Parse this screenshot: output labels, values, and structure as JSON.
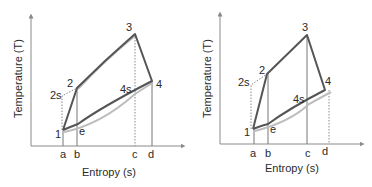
{
  "diagrams": [
    {
      "id": "left",
      "ylabel": "Temperature (T)",
      "xlabel": "Entropy (s)",
      "ticks": [
        "a",
        "b",
        "c",
        "d"
      ],
      "points": {
        "p1": "1",
        "p2": "2",
        "p2s": "2s",
        "p3": "3",
        "p4": "4",
        "p4s": "4s",
        "pe": "e"
      }
    },
    {
      "id": "right",
      "ylabel": "Temperature (T)",
      "xlabel": "Entropy (s)",
      "ticks": [
        "a",
        "b",
        "c",
        "d"
      ],
      "points": {
        "p1": "1",
        "p2": "2",
        "p2s": "2s",
        "p3": "3",
        "p4": "4",
        "p4s": "4s",
        "pe": "e"
      }
    }
  ]
}
